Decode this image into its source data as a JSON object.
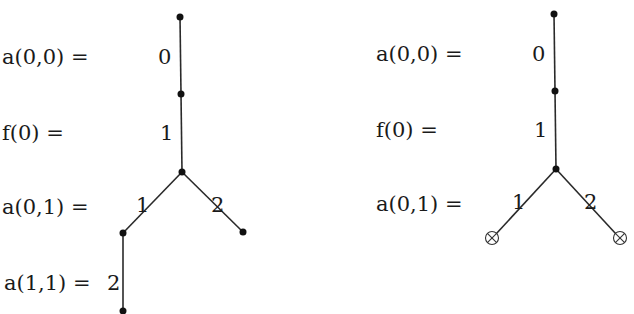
{
  "diagram": {
    "left_tree": {
      "row_labels": [
        "a(0,0) =",
        "f(0) =",
        "a(0,1) =",
        "a(1,1) ="
      ],
      "edge_labels": [
        "0",
        "1",
        "1",
        "2",
        "2"
      ],
      "nodes": [
        {
          "id": "n0",
          "x": 180,
          "y": 17,
          "type": "dot"
        },
        {
          "id": "n1",
          "x": 181,
          "y": 94,
          "type": "dot"
        },
        {
          "id": "n2",
          "x": 182,
          "y": 172,
          "type": "dot"
        },
        {
          "id": "n3",
          "x": 123,
          "y": 233,
          "type": "dot"
        },
        {
          "id": "n4",
          "x": 243,
          "y": 232,
          "type": "dot"
        },
        {
          "id": "n5",
          "x": 123,
          "y": 311,
          "type": "dot"
        }
      ]
    },
    "right_tree": {
      "row_labels": [
        "a(0,0) =",
        "f(0) =",
        "a(0,1) ="
      ],
      "edge_labels": [
        "0",
        "1",
        "1",
        "2"
      ],
      "nodes": [
        {
          "id": "m0",
          "x": 554,
          "y": 14,
          "type": "dot"
        },
        {
          "id": "m1",
          "x": 555,
          "y": 91,
          "type": "dot"
        },
        {
          "id": "m2",
          "x": 556,
          "y": 169,
          "type": "dot"
        },
        {
          "id": "m3",
          "x": 492,
          "y": 238,
          "type": "otimes"
        },
        {
          "id": "m4",
          "x": 620,
          "y": 238,
          "type": "otimes"
        }
      ]
    }
  }
}
